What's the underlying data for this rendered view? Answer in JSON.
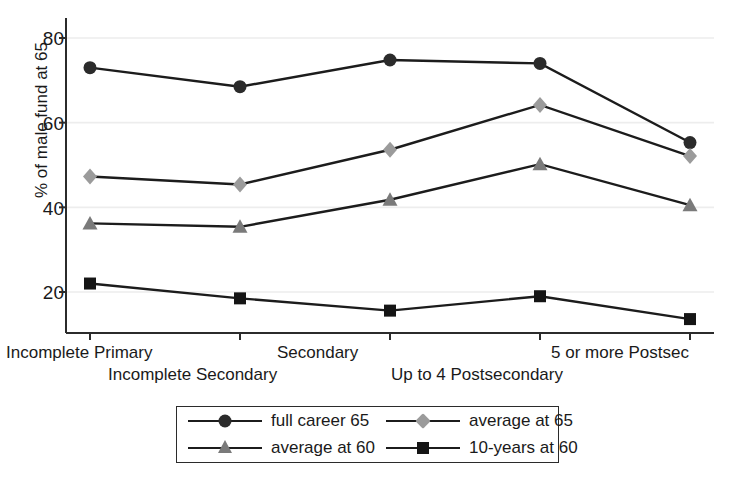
{
  "chart_data": {
    "type": "line",
    "title": "",
    "xlabel": "",
    "ylabel": "% of male fund at 65",
    "categories": [
      "Incomplete Primary",
      "Incomplete Secondary",
      "Secondary",
      "Up to 4 Postsecondary",
      "5 or more Postsec"
    ],
    "ylim": [
      10,
      84
    ],
    "yticks": [
      20,
      40,
      60,
      80
    ],
    "ytick_labels": [
      "20",
      "40",
      "60",
      "80"
    ],
    "grid": "horizontal",
    "legend_position": "bottom-center",
    "series": [
      {
        "name": "full career 65",
        "marker": "circle",
        "color": "#2b2b2b",
        "line_color": "#1c1c1c",
        "values": [
          73.0,
          68.5,
          74.8,
          74.0,
          55.3
        ]
      },
      {
        "name": "average at 65",
        "marker": "diamond",
        "color": "#9b9b9b",
        "line_color": "#1c1c1c",
        "values": [
          47.3,
          45.4,
          53.6,
          64.2,
          52.1
        ]
      },
      {
        "name": "average at 60",
        "marker": "triangle",
        "color": "#7a7a7a",
        "line_color": "#1c1c1c",
        "values": [
          36.2,
          35.4,
          41.8,
          50.2,
          40.5
        ]
      },
      {
        "name": "10-years at 60",
        "marker": "square",
        "color": "#151515",
        "line_color": "#1c1c1c",
        "values": [
          22.0,
          18.5,
          15.6,
          19.0,
          13.6
        ]
      }
    ]
  },
  "axis": {
    "ylabel": "% of male fund at 65",
    "ytick_0": "20",
    "ytick_1": "40",
    "ytick_2": "60",
    "ytick_3": "80",
    "xtick_0": "Incomplete Primary",
    "xtick_1": "Incomplete Secondary",
    "xtick_2": "Secondary",
    "xtick_3": "Up to 4 Postsecondary",
    "xtick_4": "5 or more Postsec"
  },
  "legend": {
    "items": [
      {
        "label": "full career 65"
      },
      {
        "label": "average at 65"
      },
      {
        "label": "average at 60"
      },
      {
        "label": "10-years at 60"
      }
    ]
  }
}
